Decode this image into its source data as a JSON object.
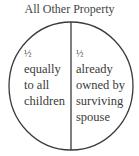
{
  "diagram": {
    "title": "All Other Property",
    "shape": "circle divided vertically into two halves",
    "colors": {
      "stroke": "#3a3a3a",
      "background": "#ffffff",
      "text": "#3a3a3a"
    },
    "sections": [
      {
        "fraction": "½",
        "lines": [
          "equally",
          "to all",
          "children"
        ]
      },
      {
        "fraction": "½",
        "lines": [
          "already",
          "owned by",
          "surviving",
          "spouse"
        ]
      }
    ]
  }
}
